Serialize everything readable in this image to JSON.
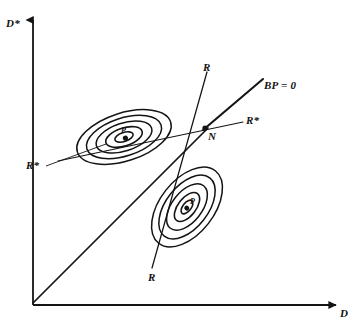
{
  "figure": {
    "axes": {
      "y_label": "D*",
      "x_label": "D",
      "y_axis": {
        "x": 33,
        "y_top": 14,
        "y_bottom": 305
      },
      "x_axis": {
        "y": 305,
        "x_left": 33,
        "x_right": 343
      }
    },
    "lines": [
      {
        "id": "diagonal-45",
        "label": "",
        "x1": 33,
        "y1": 303,
        "x2": 208,
        "y2": 128,
        "width": 1.6
      },
      {
        "id": "bp-locus",
        "label": "BP = 0",
        "x1": 205,
        "y1": 128,
        "x2": 263,
        "y2": 79,
        "width": 2.0
      },
      {
        "id": "r-locus",
        "label": "R",
        "x1": 207,
        "y1": 72,
        "x2": 152,
        "y2": 268,
        "width": 1.3
      },
      {
        "id": "rstar-locus",
        "label": "R*",
        "x1": 58,
        "y1": 161,
        "x2": 243,
        "y2": 122,
        "width": 1.1
      }
    ],
    "point": {
      "name": "N",
      "label": "N",
      "x": 205,
      "y": 128
    },
    "labels": {
      "y_axis": "D*",
      "x_axis": "D",
      "bp_locus": "BP = 0",
      "r_top": "R",
      "r_bottom": "R",
      "rstar_right": "R*",
      "rstar_left": "R*",
      "equilibrium_point": "N",
      "upper_center": "P",
      "lower_center": "P"
    },
    "contour_clusters": [
      {
        "id": "upper-left-cluster",
        "center_x": 124,
        "center_y": 137,
        "rotation_deg": -18,
        "center_label": "P",
        "rings": [
          {
            "rx": 9,
            "ry": 4
          },
          {
            "rx": 19,
            "ry": 9
          },
          {
            "rx": 29,
            "ry": 14
          },
          {
            "rx": 39,
            "ry": 19
          },
          {
            "rx": 49,
            "ry": 24
          }
        ],
        "callout": {
          "x1": 48,
          "y1": 166,
          "x2": 104,
          "y2": 144,
          "label": "R*"
        }
      },
      {
        "id": "lower-right-cluster",
        "center_x": 187,
        "center_y": 207,
        "rotation_deg": -52,
        "center_label": "P",
        "rings": [
          {
            "rx": 8,
            "ry": 4
          },
          {
            "rx": 17,
            "ry": 9
          },
          {
            "rx": 27,
            "ry": 15
          },
          {
            "rx": 37,
            "ry": 21
          },
          {
            "rx": 46,
            "ry": 27
          }
        ]
      }
    ],
    "colors": {
      "stroke": "#141414",
      "background": "#ffffff",
      "text": "#111111"
    }
  }
}
